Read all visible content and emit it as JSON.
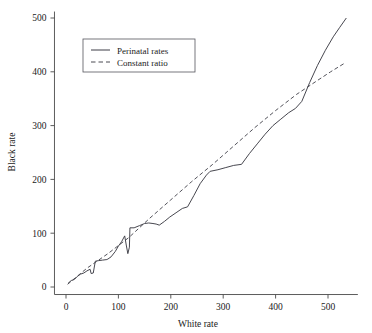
{
  "chart_data": {
    "type": "line",
    "title": "",
    "subtitle": "",
    "xlabel": "White rate",
    "ylabel": "Black rate",
    "xlim": [
      -25,
      560
    ],
    "ylim": [
      -18,
      515
    ],
    "xticks": [
      0,
      100,
      200,
      300,
      400,
      500
    ],
    "yticks": [
      0,
      100,
      200,
      300,
      400,
      500
    ],
    "xtick_labels": [
      "0",
      "100",
      "200",
      "300",
      "400",
      "500"
    ],
    "ytick_labels": [
      "0",
      "100",
      "200",
      "300",
      "400",
      "500"
    ],
    "grid": false,
    "legend_position": "upper left",
    "series": [
      {
        "name": "Perinatal rates",
        "style": "solid",
        "color": "#3d3d46",
        "points": [
          [
            4,
            7
          ],
          [
            10,
            12
          ],
          [
            16,
            14
          ],
          [
            22,
            20
          ],
          [
            28,
            24
          ],
          [
            34,
            26
          ],
          [
            40,
            30
          ],
          [
            46,
            33
          ],
          [
            48,
            25
          ],
          [
            52,
            26
          ],
          [
            56,
            48
          ],
          [
            62,
            49
          ],
          [
            70,
            50
          ],
          [
            78,
            51
          ],
          [
            80,
            52
          ],
          [
            86,
            56
          ],
          [
            94,
            66
          ],
          [
            100,
            76
          ],
          [
            106,
            84
          ],
          [
            112,
            95
          ],
          [
            115,
            78
          ],
          [
            118,
            62
          ],
          [
            121,
            74
          ],
          [
            122,
            110
          ],
          [
            130,
            110
          ],
          [
            140,
            114
          ],
          [
            150,
            118
          ],
          [
            158,
            119
          ],
          [
            166,
            118
          ],
          [
            172,
            117
          ],
          [
            178,
            115
          ],
          [
            188,
            122
          ],
          [
            198,
            130
          ],
          [
            210,
            138
          ],
          [
            222,
            146
          ],
          [
            232,
            149
          ],
          [
            244,
            170
          ],
          [
            256,
            192
          ],
          [
            268,
            208
          ],
          [
            275,
            215
          ],
          [
            290,
            218
          ],
          [
            305,
            222
          ],
          [
            320,
            226
          ],
          [
            335,
            228
          ],
          [
            350,
            248
          ],
          [
            365,
            266
          ],
          [
            380,
            284
          ],
          [
            395,
            300
          ],
          [
            410,
            312
          ],
          [
            425,
            324
          ],
          [
            438,
            332
          ],
          [
            450,
            345
          ],
          [
            465,
            380
          ],
          [
            480,
            412
          ],
          [
            495,
            440
          ],
          [
            510,
            465
          ],
          [
            522,
            482
          ],
          [
            535,
            500
          ]
        ]
      },
      {
        "name": "Constant ratio",
        "style": "dashed",
        "color": "#4a4a52",
        "points": [
          [
            3,
            5
          ],
          [
            40,
            35
          ],
          [
            80,
            62
          ],
          [
            120,
            92
          ],
          [
            160,
            128
          ],
          [
            200,
            162
          ],
          [
            240,
            196
          ],
          [
            280,
            228
          ],
          [
            320,
            262
          ],
          [
            360,
            296
          ],
          [
            400,
            328
          ],
          [
            440,
            358
          ],
          [
            480,
            384
          ],
          [
            505,
            400
          ],
          [
            530,
            415
          ]
        ]
      }
    ]
  },
  "legend": {
    "entries": [
      {
        "label": "Perinatal rates",
        "style": "solid"
      },
      {
        "label": "Constant ratio",
        "style": "dashed"
      }
    ]
  }
}
